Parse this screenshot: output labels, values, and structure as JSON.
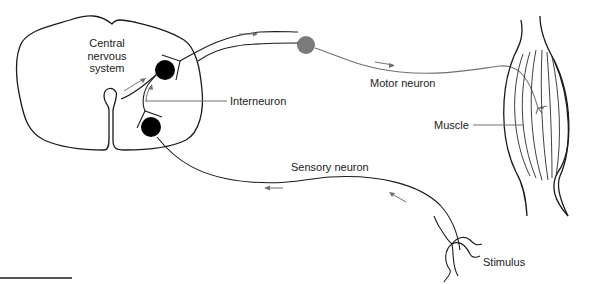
{
  "diagram": {
    "labels": {
      "cns_line1": "Central",
      "cns_line2": "nervous",
      "cns_line3": "system",
      "interneuron": "Interneuron",
      "motor_neuron": "Motor neuron",
      "sensory_neuron": "Sensory neuron",
      "muscle": "Muscle",
      "stimulus": "Stimulus"
    },
    "nodes": [
      {
        "id": "cns",
        "label": "Central nervous system",
        "shape": "spinal-cord-cross-section"
      },
      {
        "id": "motor-cell-body",
        "label": "Motor neuron cell body",
        "shape": "circle",
        "color": "#000000"
      },
      {
        "id": "sensory-cell-body",
        "label": "Sensory neuron cell body",
        "shape": "circle",
        "color": "#000000"
      },
      {
        "id": "ganglion",
        "label": "Ganglion",
        "shape": "circle",
        "color": "#7a7a7a"
      },
      {
        "id": "muscle",
        "label": "Muscle",
        "shape": "spindle"
      },
      {
        "id": "stimulus",
        "label": "Stimulus",
        "shape": "receptor-endings"
      }
    ],
    "edges": [
      {
        "from": "stimulus",
        "to": "sensory-cell-body",
        "label": "Sensory neuron",
        "direction": "toward CNS"
      },
      {
        "from": "sensory-cell-body",
        "to": "motor-cell-body",
        "label": "Interneuron",
        "direction": "upward"
      },
      {
        "from": "motor-cell-body",
        "to": "ganglion",
        "label": "",
        "direction": "away from CNS"
      },
      {
        "from": "ganglion",
        "to": "muscle",
        "label": "Motor neuron",
        "direction": "toward muscle"
      }
    ],
    "colors": {
      "line": "#1a1a1a",
      "gray_line": "#707070",
      "ganglion": "#7a7a7a",
      "cell_body": "#000000"
    }
  }
}
